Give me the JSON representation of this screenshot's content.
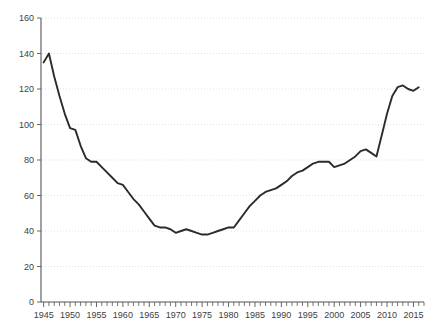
{
  "chart_data": {
    "type": "line",
    "title": "",
    "subtitle": "",
    "xlabel": "",
    "ylabel": "",
    "xlim": [
      1944.5,
      2017
    ],
    "ylim": [
      0,
      160
    ],
    "grid": true,
    "legend": null,
    "legend_position": "none",
    "y_ticks": [
      0,
      20,
      40,
      60,
      80,
      100,
      120,
      140,
      160
    ],
    "y_tick_labels": [
      "0",
      "20",
      "40",
      "60",
      "80",
      "100",
      "120",
      "140",
      "160"
    ],
    "x_ticks_major": [
      1945,
      1950,
      1955,
      1960,
      1965,
      1970,
      1975,
      1980,
      1985,
      1990,
      1995,
      2000,
      2005,
      2010,
      2015
    ],
    "x_tick_labels": [
      "1945",
      "1950",
      "1955",
      "1960",
      "1965",
      "1970",
      "1975",
      "1980",
      "1985",
      "1990",
      "1995",
      "2000",
      "2005",
      "2010",
      "2015"
    ],
    "x_minor_tick_step": 1,
    "line_color": "#2b2b2b",
    "grid_color": "#d8d8d8",
    "axis_color": "#555555",
    "series": [
      {
        "name": "value",
        "x": [
          1945,
          1946,
          1947,
          1948,
          1949,
          1950,
          1951,
          1952,
          1953,
          1954,
          1955,
          1956,
          1957,
          1958,
          1959,
          1960,
          1961,
          1962,
          1963,
          1964,
          1965,
          1966,
          1967,
          1968,
          1969,
          1970,
          1971,
          1972,
          1973,
          1974,
          1975,
          1976,
          1977,
          1978,
          1979,
          1980,
          1981,
          1982,
          1983,
          1984,
          1985,
          1986,
          1987,
          1988,
          1989,
          1990,
          1991,
          1992,
          1993,
          1994,
          1995,
          1996,
          1997,
          1998,
          1999,
          2000,
          2001,
          2002,
          2003,
          2004,
          2005,
          2006,
          2007,
          2008,
          2009,
          2010,
          2011,
          2012,
          2013,
          2014,
          2015,
          2016
        ],
        "values": [
          135,
          140,
          127,
          116,
          106,
          98,
          97,
          88,
          81,
          79,
          79,
          76,
          73,
          70,
          67,
          66,
          62,
          58,
          55,
          51,
          47,
          43,
          42,
          42,
          41,
          39,
          40,
          41,
          40,
          39,
          38,
          38,
          39,
          40,
          41,
          42,
          42,
          46,
          50,
          54,
          57,
          60,
          62,
          63,
          64,
          66,
          68,
          71,
          73,
          74,
          76,
          78,
          79,
          79,
          79,
          76,
          77,
          78,
          80,
          82,
          85,
          86,
          84,
          82,
          94,
          106,
          116,
          121,
          122,
          120,
          119,
          121
        ]
      }
    ]
  }
}
